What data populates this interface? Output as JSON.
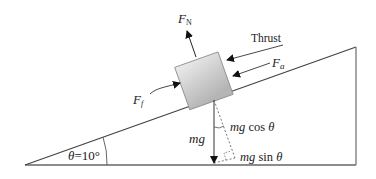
{
  "diagram": {
    "labels": {
      "normal_force": "F",
      "normal_force_sub": "N",
      "thrust": "Thrust",
      "applied_force": "F",
      "applied_force_sub": "a",
      "friction_force": "F",
      "friction_force_sub": "f",
      "weight": "mg",
      "weight_perp": "mg cos θ",
      "weight_parallel": "mg sin θ",
      "angle": "θ =10°"
    },
    "incline_angle_deg": 10,
    "colors": {
      "line": "#555555",
      "block_fill_top": "#e6e6e6",
      "block_fill_bottom": "#b8b8b8",
      "arrow": "#222222"
    }
  }
}
